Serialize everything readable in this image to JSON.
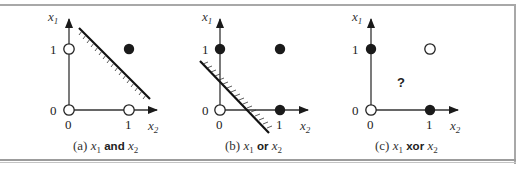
{
  "figure": {
    "panels": [
      {
        "id": "a",
        "caption_prefix": "(a) ",
        "var1": "x",
        "var1_sub": "1",
        "operator": "and",
        "var2": "x",
        "var2_sub": "2",
        "axis_y_label": "x",
        "axis_y_sub": "1",
        "axis_x_label": "x",
        "axis_x_sub": "2",
        "tick_y0": "0",
        "tick_y1": "1",
        "tick_x0": "0",
        "tick_x1": "1",
        "points": [
          {
            "x1": 0,
            "x2": 0,
            "filled": false
          },
          {
            "x1": 1,
            "x2": 0,
            "filled": false
          },
          {
            "x1": 0,
            "x2": 1,
            "filled": false
          },
          {
            "x1": 1,
            "x2": 1,
            "filled": true
          }
        ],
        "separator": "linear"
      },
      {
        "id": "b",
        "caption_prefix": "(b) ",
        "var1": "x",
        "var1_sub": "1",
        "operator": "or",
        "var2": "x",
        "var2_sub": "2",
        "axis_y_label": "x",
        "axis_y_sub": "1",
        "axis_x_label": "x",
        "axis_x_sub": "2",
        "tick_y0": "0",
        "tick_y1": "1",
        "tick_x0": "0",
        "tick_x1": "1",
        "points": [
          {
            "x1": 0,
            "x2": 0,
            "filled": false
          },
          {
            "x1": 1,
            "x2": 0,
            "filled": true
          },
          {
            "x1": 0,
            "x2": 1,
            "filled": true
          },
          {
            "x1": 1,
            "x2": 1,
            "filled": true
          }
        ],
        "separator": "linear"
      },
      {
        "id": "c",
        "caption_prefix": "(c) ",
        "var1": "x",
        "var1_sub": "1",
        "operator": "xor",
        "var2": "x",
        "var2_sub": "2",
        "axis_y_label": "x",
        "axis_y_sub": "1",
        "axis_x_label": "x",
        "axis_x_sub": "2",
        "tick_y0": "0",
        "tick_y1": "1",
        "tick_x0": "0",
        "tick_x1": "1",
        "unknown_marker": "?",
        "points": [
          {
            "x1": 0,
            "x2": 0,
            "filled": false
          },
          {
            "x1": 1,
            "x2": 0,
            "filled": true
          },
          {
            "x1": 0,
            "x2": 1,
            "filled": true
          },
          {
            "x1": 1,
            "x2": 1,
            "filled": false
          }
        ],
        "separator": "none"
      }
    ],
    "colors": {
      "ink": "#1a1a1a",
      "rule": "#a8a8a8"
    }
  }
}
